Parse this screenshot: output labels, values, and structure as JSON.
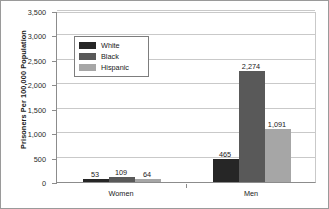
{
  "chart_data": {
    "type": "bar",
    "title": "",
    "subtitle": "",
    "xlabel": "",
    "ylabel": "Prisoners Per 100,000 Population",
    "categories": [
      "Women",
      "Men"
    ],
    "series": [
      {
        "name": "White",
        "color": "#262626",
        "values": [
          53,
          465
        ]
      },
      {
        "name": "Black",
        "color": "#595959",
        "values": [
          109,
          2274
        ]
      },
      {
        "name": "Hispanic",
        "color": "#a6a6a6",
        "values": [
          64,
          1091
        ]
      }
    ],
    "data_labels": [
      [
        "53",
        "109",
        "64"
      ],
      [
        "465",
        "2,274",
        "1,091"
      ]
    ],
    "ylim": [
      0,
      3500
    ],
    "yticks": [
      0,
      500,
      1000,
      1500,
      2000,
      2500,
      3000,
      3500
    ],
    "ytick_labels": [
      "0",
      "500",
      "1,000",
      "1,500",
      "2,000",
      "2,500",
      "3,000",
      "3,500"
    ],
    "grid": true,
    "grid_axis": "y",
    "legend_position": "upper-left-inside",
    "legend_entries": [
      "White",
      "Black",
      "Hispanic"
    ],
    "frame": true,
    "background_color": "#ffffff",
    "gridline_color": "#c9c9c9",
    "axis_color": "#8c8c8c",
    "text_color": "#1a1a1a"
  }
}
